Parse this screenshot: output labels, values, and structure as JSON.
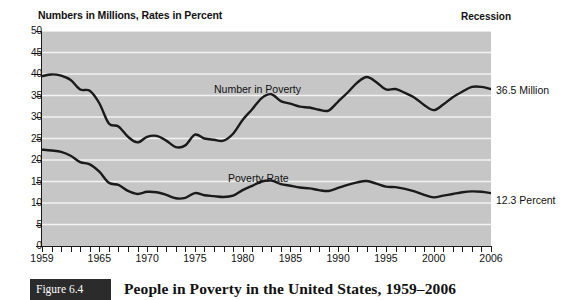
{
  "figure": {
    "number_label": "Figure 6.4",
    "caption": "People in Poverty in the United States, 1959–2006"
  },
  "chart": {
    "title": "Numbers in Millions, Rates in Percent",
    "recession_header": "Recession",
    "series_labels": {
      "number_in_poverty": "Number in Poverty",
      "poverty_rate": "Poverty Rate"
    },
    "end_annotations": {
      "number_in_poverty": "36.5 Million",
      "poverty_rate": "12.3 Percent"
    },
    "colors": {
      "plot_background": "#c6c6c6",
      "gridline": "#f2f2f2",
      "line": "#1a1a1a",
      "axis": "#1a1a1a",
      "figure_box": "#2b2b2b"
    }
  },
  "chart_data": {
    "type": "line",
    "title": "People in Poverty in the United States, 1959–2006",
    "subtitle": "Numbers in Millions, Rates in Percent",
    "xlabel": "",
    "ylabel": "Numbers in Millions, Rates in Percent",
    "xlim": [
      1959,
      2006
    ],
    "ylim": [
      0,
      50
    ],
    "grid": "horizontal",
    "legend": "inline-labels",
    "yticks": [
      0,
      5,
      10,
      15,
      20,
      25,
      30,
      35,
      40,
      45,
      50
    ],
    "xticks_labeled": [
      1959,
      1965,
      1970,
      1975,
      1980,
      1985,
      1990,
      1995,
      2000,
      2006
    ],
    "xticks_minor_step": 1,
    "x": [
      1959,
      1960,
      1961,
      1962,
      1963,
      1964,
      1965,
      1966,
      1967,
      1968,
      1969,
      1970,
      1971,
      1972,
      1973,
      1974,
      1975,
      1976,
      1977,
      1978,
      1979,
      1980,
      1981,
      1982,
      1983,
      1984,
      1985,
      1986,
      1987,
      1988,
      1989,
      1990,
      1991,
      1992,
      1993,
      1994,
      1995,
      1996,
      1997,
      1998,
      1999,
      2000,
      2001,
      2002,
      2003,
      2004,
      2005,
      2006
    ],
    "series": [
      {
        "name": "Number in Poverty",
        "units": "millions",
        "end_label": "36.5 Million",
        "values": [
          39.5,
          39.9,
          39.6,
          38.6,
          36.4,
          36.1,
          33.2,
          28.5,
          27.8,
          25.4,
          24.1,
          25.4,
          25.6,
          24.5,
          23.0,
          23.4,
          25.9,
          25.0,
          24.7,
          24.5,
          26.1,
          29.3,
          31.8,
          34.4,
          35.3,
          33.7,
          33.1,
          32.4,
          32.2,
          31.7,
          31.5,
          33.6,
          35.7,
          38.0,
          39.3,
          38.1,
          36.4,
          36.5,
          35.6,
          34.5,
          32.8,
          31.6,
          32.9,
          34.6,
          35.9,
          37.0,
          37.0,
          36.5
        ]
      },
      {
        "name": "Poverty Rate",
        "units": "percent",
        "end_label": "12.3 Percent",
        "values": [
          22.4,
          22.2,
          21.9,
          21.0,
          19.5,
          19.0,
          17.3,
          14.7,
          14.2,
          12.8,
          12.1,
          12.6,
          12.5,
          11.9,
          11.1,
          11.2,
          12.3,
          11.8,
          11.6,
          11.4,
          11.7,
          13.0,
          14.0,
          15.0,
          15.2,
          14.4,
          14.0,
          13.6,
          13.4,
          13.0,
          12.8,
          13.5,
          14.2,
          14.8,
          15.1,
          14.5,
          13.8,
          13.7,
          13.3,
          12.7,
          11.9,
          11.3,
          11.7,
          12.1,
          12.5,
          12.7,
          12.6,
          12.3
        ]
      }
    ]
  }
}
